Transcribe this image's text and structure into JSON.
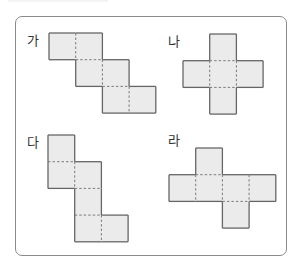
{
  "figure": {
    "cell_size": 26.7,
    "colors": {
      "fill": "#ebebeb",
      "border": "#666666",
      "fold": "#7a7a7a",
      "frame": "#8a8a8a"
    },
    "nets": [
      {
        "id": "ga",
        "label": "가",
        "label_pos": [
          27,
          34
        ],
        "origin": [
          49,
          33
        ],
        "cells": [
          [
            0,
            0
          ],
          [
            1,
            0
          ],
          [
            1,
            1
          ],
          [
            2,
            1
          ],
          [
            2,
            2
          ],
          [
            3,
            2
          ]
        ]
      },
      {
        "id": "na",
        "label": "나",
        "label_pos": [
          168,
          35
        ],
        "origin": [
          183,
          34
        ],
        "cells": [
          [
            1,
            0
          ],
          [
            0,
            1
          ],
          [
            1,
            1
          ],
          [
            2,
            1
          ],
          [
            1,
            2
          ]
        ]
      },
      {
        "id": "da",
        "label": "다",
        "label_pos": [
          27,
          136
        ],
        "origin": [
          48,
          135
        ],
        "cells": [
          [
            0,
            0
          ],
          [
            0,
            1
          ],
          [
            1,
            1
          ],
          [
            1,
            2
          ],
          [
            1,
            3
          ],
          [
            2,
            3
          ]
        ]
      },
      {
        "id": "ra",
        "label": "라",
        "label_pos": [
          168,
          134
        ],
        "origin": [
          169,
          148
        ],
        "cells": [
          [
            1,
            0
          ],
          [
            0,
            1
          ],
          [
            1,
            1
          ],
          [
            2,
            1
          ],
          [
            3,
            1
          ],
          [
            2,
            2
          ]
        ]
      }
    ]
  }
}
